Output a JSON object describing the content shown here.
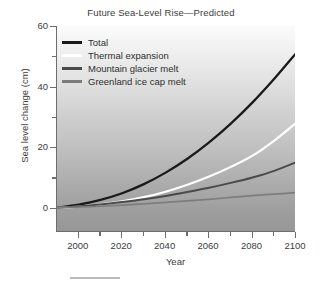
{
  "chart_data": {
    "type": "line",
    "title": "Future Sea-Level Rise—Predicted",
    "xlabel": "Year",
    "ylabel": "Sea level change (cm)",
    "xlim": [
      1990,
      2100
    ],
    "ylim": [
      -8,
      60
    ],
    "grid": false,
    "legend_position": "top-left",
    "x_ticks_major": [
      2000,
      2020,
      2040,
      2060,
      2080,
      2100
    ],
    "x_ticks_minor": [
      2010,
      2030,
      2050,
      2070,
      2090
    ],
    "y_ticks_major": [
      0,
      20,
      40,
      60
    ],
    "y_ticks_minor": [
      10,
      30,
      50
    ],
    "x": [
      1990,
      2000,
      2010,
      2020,
      2030,
      2040,
      2050,
      2060,
      2070,
      2080,
      2090,
      2100
    ],
    "series": [
      {
        "name": "Total",
        "color": "#1a1a1a",
        "values": [
          0,
          1.0,
          2.6,
          4.8,
          7.8,
          11.6,
          16.2,
          21.6,
          27.8,
          34.8,
          42.6,
          51.0
        ]
      },
      {
        "name": "Thermal expansion",
        "color": "#ffffff",
        "values": [
          0,
          0.4,
          1.1,
          2.1,
          3.5,
          5.3,
          7.6,
          10.3,
          13.5,
          17.2,
          22.2,
          28.0
        ]
      },
      {
        "name": "Mountain glacier melt",
        "color": "#4a4a4a",
        "values": [
          0,
          0.5,
          1.1,
          1.9,
          2.8,
          3.9,
          5.2,
          6.6,
          8.2,
          10.0,
          12.2,
          15.0
        ]
      },
      {
        "name": "Greenland ice cap melt",
        "color": "#7d7d7d",
        "values": [
          0,
          0.2,
          0.5,
          0.9,
          1.3,
          1.8,
          2.3,
          2.8,
          3.4,
          4.0,
          4.5,
          5.0
        ]
      }
    ]
  }
}
